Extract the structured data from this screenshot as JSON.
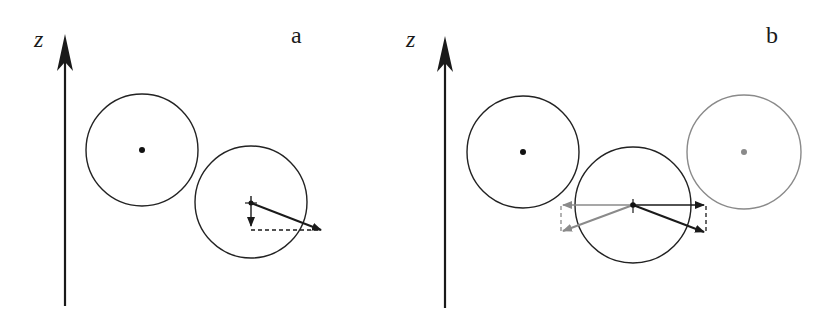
{
  "panels": [
    {
      "id": "a",
      "label": "a",
      "axis_label": "z",
      "circles": [
        {
          "cx": 142,
          "cy": 150,
          "r": 56,
          "color": "#222222",
          "center_dot": true
        },
        {
          "cx": 251,
          "cy": 202,
          "r": 56,
          "color": "#222222",
          "center_dot": false
        }
      ]
    },
    {
      "id": "b",
      "label": "b",
      "axis_label": "z",
      "circles": [
        {
          "cx": 523,
          "cy": 152,
          "r": 56,
          "color": "#222222",
          "center_dot": true
        },
        {
          "cx": 633,
          "cy": 205,
          "r": 58,
          "color": "#222222",
          "center_dot": false
        },
        {
          "cx": 744,
          "cy": 152,
          "r": 57,
          "color": "#8a8a8a",
          "center_dot": true
        }
      ]
    }
  ],
  "colors": {
    "ink": "#1a1a1a",
    "gray": "#8a8a8a"
  }
}
